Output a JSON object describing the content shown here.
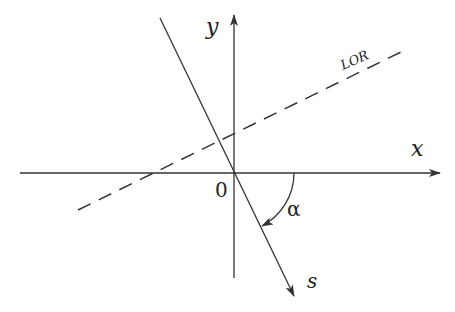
{
  "diagram": {
    "type": "coordinate-geometry",
    "axes": {
      "x_label": "x",
      "y_label": "y",
      "origin_label": "0"
    },
    "lines": {
      "lor_label": "LOR",
      "s_label": "s"
    },
    "angle": {
      "label": "α",
      "description": "angle from x-axis to s-axis (clockwise)"
    },
    "colors": {
      "stroke": "#333333",
      "background": "#ffffff"
    }
  }
}
